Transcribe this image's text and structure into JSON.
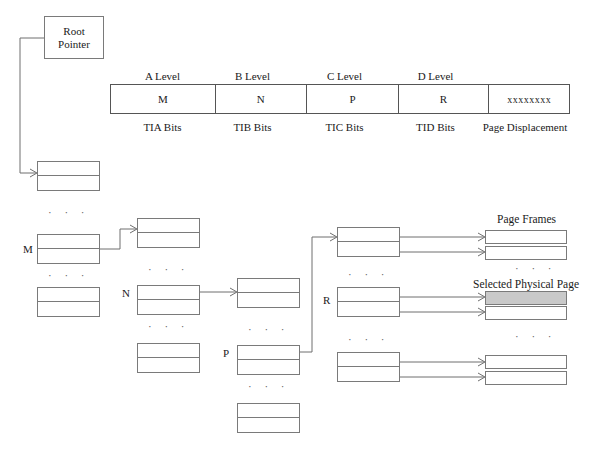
{
  "diagram": {
    "title_semantic": "multi-level-page-table-address-translation",
    "root_pointer": {
      "line1": "Root",
      "line2": "Pointer"
    }
  },
  "address_bar": {
    "level_captions": [
      "A Level",
      "B Level",
      "C Level",
      "D Level",
      ""
    ],
    "cells": [
      {
        "value": "M",
        "caption": "TIA Bits"
      },
      {
        "value": "N",
        "caption": "TIB Bits"
      },
      {
        "value": "P",
        "caption": "TIC Bits"
      },
      {
        "value": "R",
        "caption": "TID Bits"
      },
      {
        "value": "xxxxxxxx",
        "caption": "Page Displacement"
      }
    ]
  },
  "columns": {
    "a_level": {
      "selected_label": "M",
      "ellipsis": "· · ·"
    },
    "b_level": {
      "selected_label": "N",
      "ellipsis": "· · ·"
    },
    "c_level": {
      "selected_label": "P",
      "ellipsis": "· · ·"
    },
    "d_level": {
      "selected_label": "R",
      "ellipsis": "· · ·"
    }
  },
  "page_frames": {
    "title": "Page Frames",
    "selected_title": "Selected Physical Page",
    "ellipsis": "· · ·"
  },
  "colors": {
    "stroke": "#7a7a7a",
    "text": "#1a1a1a",
    "selected_fill": "#c9c9c9",
    "background": "#ffffff"
  }
}
